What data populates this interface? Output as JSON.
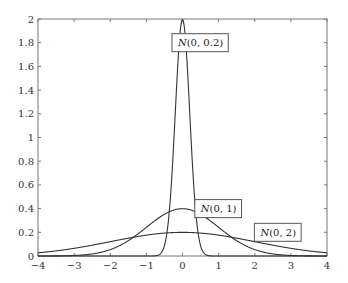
{
  "chart_data": {
    "type": "line",
    "title": "",
    "xlabel": "",
    "ylabel": "",
    "xlim": [
      -4,
      4
    ],
    "ylim": [
      0,
      2
    ],
    "grid": false,
    "x_ticks": [
      -4,
      -3,
      -2,
      -1,
      0,
      1,
      2,
      3,
      4
    ],
    "x_tick_labels": [
      "−4",
      "−3",
      "−2",
      "−1",
      "0",
      "1",
      "2",
      "3",
      "4"
    ],
    "y_ticks": [
      0,
      0.2,
      0.4,
      0.6,
      0.8,
      1,
      1.2,
      1.4,
      1.6,
      1.8,
      2
    ],
    "y_tick_labels": [
      "0",
      "0.2",
      "0.4",
      "0.6",
      "0.8",
      "1",
      "1.2",
      "1.4",
      "1.6",
      "1.8",
      "2"
    ],
    "series": [
      {
        "name": "N(0, 0.2)",
        "distribution": "normal",
        "mean": 0,
        "sigma": 0.2,
        "peak": 1.995,
        "label_prefix": "N",
        "label_args": "(0, 0.2)",
        "label_anchor": {
          "x": 0.5,
          "y": 1.8
        }
      },
      {
        "name": "N(0, 1)",
        "distribution": "normal",
        "mean": 0,
        "sigma": 1,
        "peak": 0.399,
        "label_prefix": "N",
        "label_args": "(0, 1)",
        "label_anchor": {
          "x": 1.0,
          "y": 0.4
        }
      },
      {
        "name": "N(0, 2)",
        "distribution": "normal",
        "mean": 0,
        "sigma": 2,
        "peak": 0.199,
        "label_prefix": "N",
        "label_args": "(0, 2)",
        "label_anchor": {
          "x": 2.65,
          "y": 0.2
        }
      }
    ],
    "colors": {
      "axis": "#777777",
      "curve": "#333333",
      "box_border": "#555555"
    }
  }
}
